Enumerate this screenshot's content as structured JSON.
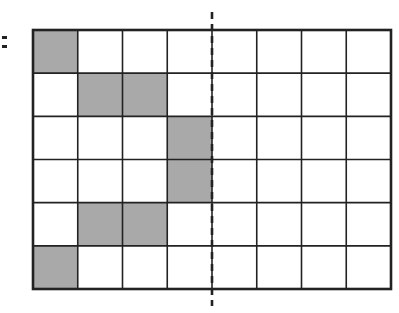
{
  "diagram": {
    "type": "grid-reflection",
    "grid": {
      "rows": 6,
      "cols": 8,
      "left": 33,
      "top": 30,
      "right": 391,
      "bottom": 289,
      "line_color": "#222222",
      "shade_color": "#a9a9a9"
    },
    "shaded_cells": [
      {
        "row": 0,
        "col": 0
      },
      {
        "row": 1,
        "col": 1
      },
      {
        "row": 1,
        "col": 2
      },
      {
        "row": 2,
        "col": 3
      },
      {
        "row": 3,
        "col": 3
      },
      {
        "row": 4,
        "col": 1
      },
      {
        "row": 4,
        "col": 2
      },
      {
        "row": 5,
        "col": 0
      }
    ],
    "mirror_line": {
      "style": "dashed",
      "x": 212,
      "y_start": 12,
      "y_end": 306,
      "color": "#222222"
    }
  }
}
